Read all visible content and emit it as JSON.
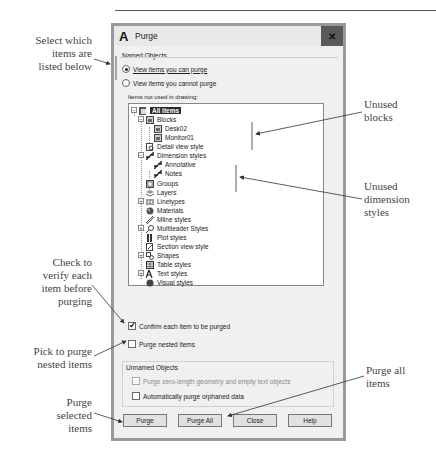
{
  "dialog": {
    "title": "Purge",
    "app_icon": "A",
    "close_glyph": "✕",
    "named_objects": {
      "label": "Named Objects",
      "radio_options": [
        {
          "label": "View items you can purge",
          "selected": true
        },
        {
          "label": "View items you cannot purge",
          "selected": false
        }
      ],
      "tree_label": "Items not used in drawing:"
    },
    "tree": [
      {
        "label": "All items",
        "level": 0,
        "expander": "−",
        "icon": "drawing-icon",
        "selected": true
      },
      {
        "label": "Blocks",
        "level": 1,
        "expander": "−",
        "icon": "block-icon"
      },
      {
        "label": "Desk02",
        "level": 2,
        "icon": "block-icon"
      },
      {
        "label": "Monitor01",
        "level": 2,
        "icon": "block-icon"
      },
      {
        "label": "Detail view style",
        "level": 1,
        "icon": "detail-view-icon"
      },
      {
        "label": "Dimension styles",
        "level": 1,
        "expander": "−",
        "icon": "dimension-icon"
      },
      {
        "label": "Annotative",
        "level": 2,
        "icon": "dimension-icon"
      },
      {
        "label": "Notes",
        "level": 2,
        "icon": "dimension-icon"
      },
      {
        "label": "Groups",
        "level": 1,
        "icon": "group-icon"
      },
      {
        "label": "Layers",
        "level": 1,
        "icon": "layers-icon"
      },
      {
        "label": "Linetypes",
        "level": 1,
        "expander": "+",
        "icon": "linetype-icon"
      },
      {
        "label": "Materials",
        "level": 1,
        "icon": "material-icon"
      },
      {
        "label": "Mline styles",
        "level": 1,
        "icon": "mline-icon"
      },
      {
        "label": "Multileader Styles",
        "level": 1,
        "expander": "+",
        "icon": "multileader-icon"
      },
      {
        "label": "Plot styles",
        "level": 1,
        "icon": "plot-style-icon"
      },
      {
        "label": "Section view style",
        "level": 1,
        "icon": "section-view-icon"
      },
      {
        "label": "Shapes",
        "level": 1,
        "expander": "+",
        "icon": "shape-icon"
      },
      {
        "label": "Table styles",
        "level": 1,
        "icon": "table-icon"
      },
      {
        "label": "Text styles",
        "level": 1,
        "expander": "+",
        "icon": "text-style-icon"
      },
      {
        "label": "Visual styles",
        "level": 1,
        "icon": "visual-style-icon"
      }
    ],
    "options": {
      "confirm": {
        "label": "Confirm each item to be purged",
        "checked": true
      },
      "nested": {
        "label": "Purge nested items",
        "checked": false
      }
    },
    "unnamed_objects": {
      "label": "Unnamed Objects",
      "zero_length": {
        "label": "Purge zero-length geometry and empty text objects",
        "checked": false,
        "disabled": true
      },
      "orphaned": {
        "label": "Automatically purge orphaned data",
        "checked": false
      }
    },
    "buttons": {
      "purge": "Purge",
      "purge_all": "Purge All",
      "close": "Close",
      "help": "Help"
    }
  },
  "callouts": {
    "select_which": [
      "Select which",
      "items are",
      "listed below"
    ],
    "unused_blocks": [
      "Unused",
      "blocks"
    ],
    "unused_dimension_styles": [
      "Unused",
      "dimension",
      "styles"
    ],
    "check_to_verify": [
      "Check to",
      "verify each",
      "item before",
      "purging"
    ],
    "pick_nested": [
      "Pick to purge",
      "nested items"
    ],
    "purge_selected": [
      "Purge",
      "selected",
      "items"
    ],
    "purge_all": [
      "Purge all",
      "items"
    ]
  }
}
